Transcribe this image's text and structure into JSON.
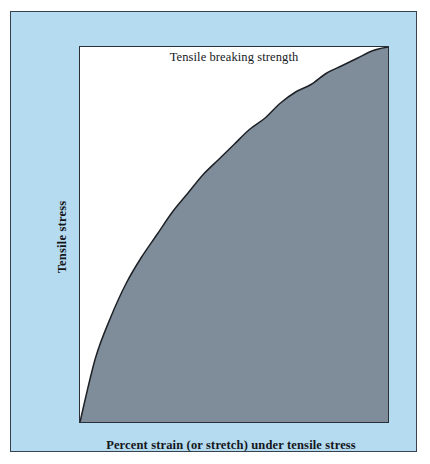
{
  "figure": {
    "background_color": "#ffffff",
    "panel_color": "#b4dbf0",
    "panel_border_color": "#38414e",
    "plot_background_color": "#ffffff",
    "plot_border_color": "#2b3038"
  },
  "chart_data": {
    "type": "area",
    "title": "Tensile breaking strength",
    "xlabel": "Percent strain (or stretch) under tensile stress",
    "ylabel": "Tensile stress",
    "grid": false,
    "legend": "none",
    "xlim": [
      0,
      100
    ],
    "ylim": [
      0,
      100
    ],
    "xtick_labels": [],
    "ytick_labels": [],
    "fill_color": "#7f8c99",
    "line_color": "#1d2126",
    "annotations": [
      {
        "text": "Tensile breaking strength",
        "position": "top-center-inside-plot"
      }
    ],
    "series": [
      {
        "name": "Stress-strain curve",
        "x": [
          0,
          5,
          10,
          15,
          20,
          25,
          30,
          35,
          40,
          45,
          50,
          55,
          60,
          65,
          70,
          75,
          80,
          85,
          90,
          95,
          100
        ],
        "y": [
          0,
          17,
          28,
          37,
          44,
          50,
          56,
          61,
          66,
          70,
          74,
          78,
          81,
          85,
          88,
          90,
          93,
          95,
          97,
          99,
          100
        ]
      }
    ]
  }
}
